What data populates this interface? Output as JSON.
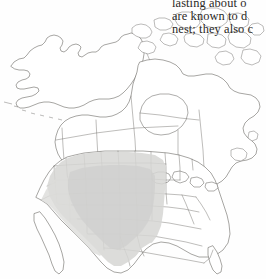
{
  "page": {
    "kind": "field-guide-range-map-page",
    "background_color": "#fefefe",
    "width": 266,
    "height": 279
  },
  "body_text": {
    "color": "#2b2926",
    "clipped_at_right_edge": true,
    "lines": [
      "lasting about o",
      "are known to d",
      "nest; they also c"
    ],
    "line_1": "lasting about o",
    "line_2": "are known to d",
    "line_3": "nest; they also c"
  },
  "map": {
    "title": "North America range map",
    "region": "North America",
    "projection_note": "conic",
    "outline_color": "#5d5b57",
    "internal_border_color": "#6d6b66",
    "land_fill": "#ffffff",
    "range": {
      "label": "breeding range",
      "shade_color": "#d6d6d4",
      "shade_opacity": "0.85",
      "coverage": "western and central United States"
    },
    "features": [
      "Alaska",
      "Aleutian Islands",
      "Canadian Arctic Archipelago",
      "Hudson Bay",
      "Great Lakes",
      "Baja California",
      "Florida peninsula",
      "Newfoundland",
      "Labrador"
    ]
  }
}
